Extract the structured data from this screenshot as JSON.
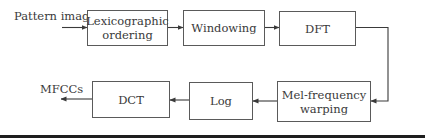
{
  "diagram": {
    "type": "flowchart",
    "input_label": "Pattern image",
    "output_label": "MFCCs",
    "nodes": [
      {
        "id": "lexicographic",
        "label_line1": "Lexicographic",
        "label_line2": "ordering"
      },
      {
        "id": "windowing",
        "label": "Windowing"
      },
      {
        "id": "dft",
        "label": "DFT"
      },
      {
        "id": "mel",
        "label_line1": "Mel-frequency",
        "label_line2": "warping"
      },
      {
        "id": "log",
        "label": "Log"
      },
      {
        "id": "dct",
        "label": "DCT"
      }
    ],
    "edges": [
      {
        "from": "Pattern image",
        "to": "lexicographic"
      },
      {
        "from": "lexicographic",
        "to": "windowing"
      },
      {
        "from": "windowing",
        "to": "dft"
      },
      {
        "from": "dft",
        "to": "mel"
      },
      {
        "from": "mel",
        "to": "log"
      },
      {
        "from": "log",
        "to": "dct"
      },
      {
        "from": "dct",
        "to": "MFCCs"
      }
    ],
    "colors": {
      "box_border": "#5a5a5a",
      "text": "#3a3a3a",
      "arrow": "#3a3a3a",
      "rule": "#1e1e1e"
    }
  }
}
